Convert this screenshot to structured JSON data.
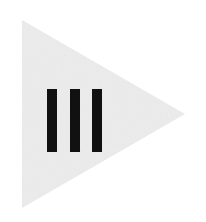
{
  "canvas": {
    "width": 206,
    "height": 222,
    "background_color": "#ffffff",
    "title": "play-pause media glyph"
  },
  "graphic": {
    "name": "right-pointing triangle with three vertical bars",
    "triangle": {
      "label": "play-triangle",
      "fill_color": "#ececec",
      "points": "22,20 22,208 185,114",
      "vertices": [
        {
          "x": 22,
          "y": 20
        },
        {
          "x": 22,
          "y": 208
        },
        {
          "x": 185,
          "y": 114
        }
      ],
      "direction": "right",
      "texture": "subtle paper noise"
    },
    "bars": {
      "label": "pause-bars",
      "count": 3,
      "fill_color": "#111111",
      "top": 89,
      "height": 63,
      "width": 10,
      "items": [
        {
          "label": "bar-1",
          "x": 47,
          "y": 89,
          "width": 10,
          "height": 63
        },
        {
          "label": "bar-2",
          "x": 70,
          "y": 89,
          "width": 10,
          "height": 63
        },
        {
          "label": "bar-3",
          "x": 92,
          "y": 89,
          "width": 10,
          "height": 63
        }
      ]
    }
  }
}
